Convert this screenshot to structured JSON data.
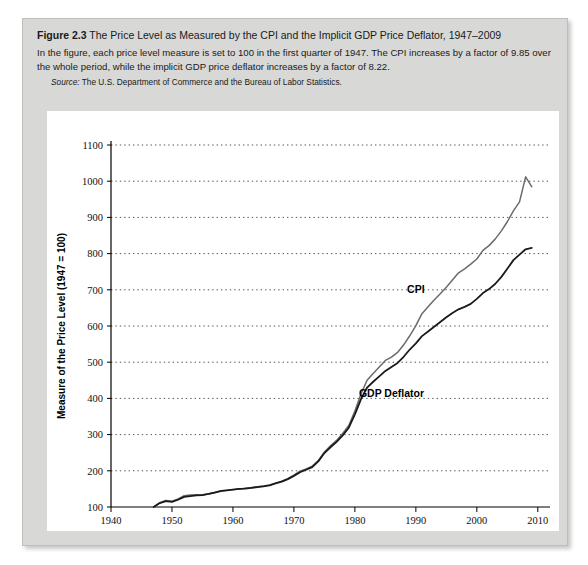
{
  "figure": {
    "label": "Figure 2.3",
    "title": "The Price Level as Measured by the CPI and the Implicit GDP Price Deflator, 1947–2009",
    "subtitle": "In the figure, each price level measure is set to 100 in the first quarter of 1947. The CPI increases by a factor of 9.85 over the whole period, while the implicit GDP price deflator increases by a factor of 8.22.",
    "source_lead": "Source:",
    "source_text": "The U.S. Department of Commerce and the Bureau of Labor Statistics."
  },
  "colors": {
    "card_background": "#d8d8d6",
    "panel_background": "#ffffff",
    "cpi_line": "#6b6b6b",
    "deflator_line": "#1a1a1a",
    "gridline": "#555555",
    "axis": "#000000"
  },
  "chart_data": {
    "type": "line",
    "title": "The Price Level as Measured by the CPI and the Implicit GDP Price Deflator, 1947–2009",
    "xlabel": "Year",
    "ylabel": "Measure of the Price Level (1947 = 100)",
    "xlim": [
      1940,
      2012
    ],
    "ylim": [
      100,
      1100
    ],
    "xticks": [
      1940,
      1950,
      1960,
      1970,
      1980,
      1990,
      2000,
      2010
    ],
    "yticks": [
      100,
      200,
      300,
      400,
      500,
      600,
      700,
      800,
      900,
      1000,
      1100
    ],
    "xtick_labels": [
      "1940",
      "1950",
      "1960",
      "1970",
      "1980",
      "1990",
      "2000",
      "2010"
    ],
    "ytick_labels": [
      "100",
      "200",
      "300",
      "400",
      "500",
      "600",
      "700",
      "800",
      "900",
      "1000",
      "1100"
    ],
    "grid": "horizontal-dotted",
    "legend": "inline-annotations",
    "annotations": [
      {
        "text": "CPI",
        "x": 1990,
        "y": 690
      },
      {
        "text": "GDP Deflator",
        "x": 1986,
        "y": 405
      }
    ],
    "x": [
      1947,
      1948,
      1949,
      1950,
      1951,
      1952,
      1953,
      1954,
      1955,
      1956,
      1957,
      1958,
      1959,
      1960,
      1961,
      1962,
      1963,
      1964,
      1965,
      1966,
      1967,
      1968,
      1969,
      1970,
      1971,
      1972,
      1973,
      1974,
      1975,
      1976,
      1977,
      1978,
      1979,
      1980,
      1981,
      1982,
      1983,
      1984,
      1985,
      1986,
      1987,
      1988,
      1989,
      1990,
      1991,
      1992,
      1993,
      1994,
      1995,
      1996,
      1997,
      1998,
      1999,
      2000,
      2001,
      2002,
      2003,
      2004,
      2005,
      2006,
      2007,
      2008,
      2009
    ],
    "series": [
      {
        "name": "CPI",
        "color": "#6b6b6b",
        "values": [
          100,
          112,
          118,
          116,
          122,
          131,
          133,
          134,
          134,
          136,
          140,
          145,
          146,
          148,
          150,
          152,
          153,
          156,
          158,
          161,
          166,
          171,
          178,
          188,
          199,
          205,
          213,
          228,
          252,
          269,
          284,
          303,
          325,
          365,
          412,
          450,
          469,
          487,
          505,
          514,
          527,
          548,
          573,
          601,
          634,
          653,
          672,
          689,
          707,
          727,
          747,
          758,
          771,
          785,
          809,
          822,
          840,
          862,
          888,
          918,
          943,
          1012,
          985
        ]
      },
      {
        "name": "GDP Deflator",
        "color": "#1a1a1a",
        "values": [
          100,
          111,
          116,
          114,
          120,
          128,
          130,
          132,
          133,
          136,
          140,
          144,
          146,
          148,
          150,
          151,
          153,
          155,
          157,
          160,
          165,
          170,
          177,
          186,
          196,
          203,
          210,
          226,
          249,
          265,
          280,
          298,
          319,
          356,
          398,
          430,
          446,
          461,
          476,
          487,
          498,
          515,
          535,
          552,
          572,
          585,
          598,
          611,
          624,
          636,
          646,
          653,
          661,
          675,
          691,
          702,
          716,
          735,
          758,
          782,
          797,
          812,
          816
        ]
      }
    ]
  }
}
